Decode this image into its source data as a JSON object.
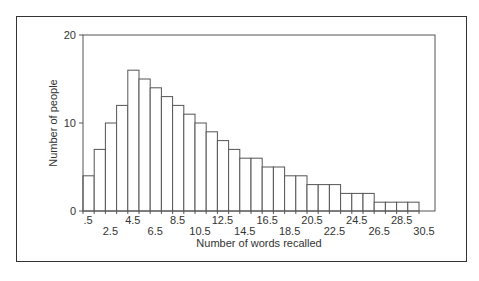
{
  "chart_data": {
    "type": "bar",
    "title": "",
    "xlabel": "Number of words recalled",
    "ylabel": "Number of people",
    "ylim": [
      0,
      20
    ],
    "yticks": [
      0,
      10,
      20
    ],
    "bin_edges_start": 0.5,
    "bin_width": 1,
    "x_tick_labels_upper": [
      ".5",
      "4.5",
      "8.5",
      "12.5",
      "16.5",
      "20.5",
      "24.5",
      "28.5"
    ],
    "x_tick_labels_lower": [
      "2.5",
      "6.5",
      "10.5",
      "14.5",
      "18.5",
      "22.5",
      "26.5",
      "30.5"
    ],
    "categories": [
      "1",
      "2",
      "3",
      "4",
      "5",
      "6",
      "7",
      "8",
      "9",
      "10",
      "11",
      "12",
      "13",
      "14",
      "15",
      "16",
      "17",
      "18",
      "19",
      "20",
      "21",
      "22",
      "23",
      "24",
      "25",
      "26",
      "27",
      "28",
      "29",
      "30"
    ],
    "values": [
      4,
      7,
      10,
      12,
      16,
      15,
      14,
      13,
      12,
      11,
      10,
      9,
      8,
      7,
      6,
      6,
      5,
      5,
      4,
      4,
      3,
      3,
      3,
      2,
      2,
      2,
      1,
      1,
      1,
      1
    ],
    "grid": false,
    "legend": null,
    "colors": {
      "bar_fill": "#ffffff",
      "bar_stroke": "#555555",
      "axis": "#555555"
    }
  }
}
